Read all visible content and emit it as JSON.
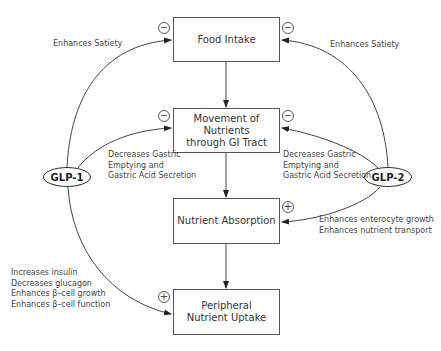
{
  "boxes": {
    "food_intake": "Food Intake",
    "movement_line1": "Movement of Nutrients",
    "movement_line2": "through GI Tract",
    "absorption": "Nutrient Absorption",
    "peripheral_line1": "Peripheral",
    "peripheral_line2": "Nutrient Uptake"
  },
  "hormones": {
    "glp1": "GLP-1",
    "glp2": "GLP-2"
  },
  "labels": {
    "glp1_satiety": "Enhances Satiety",
    "glp2_satiety": "Enhances Satiety",
    "glp1_gastric": "Decreases Gastric\nEmptying and\nGastric Acid Secretion",
    "glp2_gastric": "Decreases Gastric\nEmptying and\nGastric Acid Secretion",
    "glp2_absorption": "Enhances enterocyte growth\nEnhances nutrient transport",
    "glp1_peripheral": "Increases insulin\nDecreases glucagon\nEnhances β–cell growth\nEnhances β–cell function"
  },
  "signs": {
    "inhibit": "−",
    "stimulate": "+"
  }
}
